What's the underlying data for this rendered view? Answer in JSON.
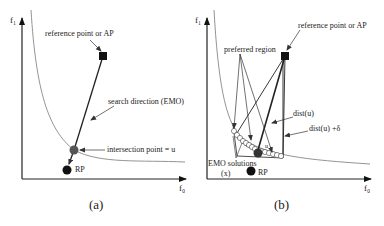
{
  "panel_a": {
    "caption": "(a)",
    "y_axis": "f₁",
    "x_axis": "f₀",
    "labels": {
      "reference_point": "reference point or AP",
      "search_direction": "search direction (EMO)",
      "intersection": "intersection point = u",
      "rp": "RP"
    }
  },
  "panel_b": {
    "caption": "(b)",
    "y_axis": "f₁",
    "x_axis": "f₀",
    "labels": {
      "preferred_region": "preferred region",
      "reference_point": "reference point or AP",
      "dist_u": "dist(u)",
      "dist_u_delta": "dist(u) +δ",
      "emo_solutions": "EMO solutions",
      "emo_x": "(x)",
      "rp": "RP",
      "u": "u"
    }
  },
  "colors": {
    "line": "#222222",
    "curve": "#888888",
    "point": "#111111",
    "intersection": "#555555"
  }
}
